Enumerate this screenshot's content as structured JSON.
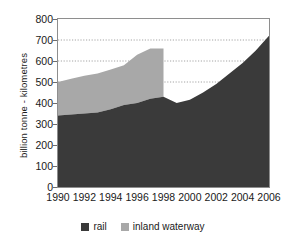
{
  "chart_data": {
    "type": "area",
    "stacked": true,
    "title": "",
    "subtitle": "",
    "xlabel": "",
    "ylabel": "billion tonne - kilometres",
    "xlim": [
      1990,
      2006
    ],
    "ylim": [
      0,
      800
    ],
    "ytick_step": 100,
    "xtick_step": 2,
    "grid": "horizontal-dotted",
    "gridlines": [
      500,
      600,
      700
    ],
    "legend_position": "bottom-center",
    "x": [
      1990,
      1991,
      1992,
      1993,
      1994,
      1995,
      1996,
      1997,
      1998,
      1999,
      2000,
      2001,
      2002,
      2003,
      2004,
      2005,
      2006
    ],
    "series": [
      {
        "name": "rail",
        "color": "#3a3a3a",
        "values": [
          340,
          345,
          350,
          355,
          370,
          390,
          400,
          420,
          430,
          400,
          415,
          450,
          490,
          540,
          590,
          650,
          720
        ]
      },
      {
        "name": "inland waterway",
        "color": "#a8a8a8",
        "values": [
          160,
          170,
          180,
          185,
          190,
          190,
          230,
          240,
          230,
          null,
          null,
          null,
          null,
          null,
          null,
          null,
          null
        ]
      }
    ],
    "series_note": "inland waterway data ends after 1998",
    "stack_top": [
      500,
      515,
      530,
      540,
      560,
      580,
      630,
      660,
      660
    ],
    "ytick_labels": [
      "0",
      "100",
      "200",
      "300",
      "400",
      "500",
      "600",
      "700",
      "800"
    ],
    "ytick_values": [
      0,
      100,
      200,
      300,
      400,
      500,
      600,
      700,
      800
    ],
    "xtick_labels": [
      "1990",
      "1992",
      "1994",
      "1996",
      "1998",
      "2000",
      "2002",
      "2004",
      "2006"
    ],
    "xtick_values": [
      1990,
      1992,
      1994,
      1996,
      1998,
      2000,
      2002,
      2004,
      2006
    ]
  },
  "legend": {
    "items": [
      {
        "label": "rail",
        "color": "#3a3a3a"
      },
      {
        "label": "inland waterway",
        "color": "#a8a8a8"
      }
    ]
  },
  "axes": {
    "y_title": "billion tonne - kilometres"
  },
  "colors": {
    "rail": "#3a3a3a",
    "inland_waterway": "#a8a8a8",
    "frame": "#8e8e8e",
    "grid": "#8e8e8e",
    "text": "#1a1a1a"
  }
}
